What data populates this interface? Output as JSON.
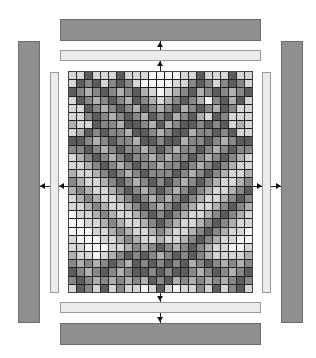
{
  "diagram": {
    "colors": {
      "outer_bar": "#8f8f8f",
      "inner_bar": "#ececec",
      "grid_line": "#222222",
      "arrow": "#111111"
    },
    "grid": {
      "cols": 23,
      "rows": 27,
      "cell_values": [
        [
          1,
          1,
          4,
          1,
          1,
          1,
          4,
          1,
          1,
          1,
          0,
          0,
          0,
          0,
          1,
          1,
          4,
          1,
          1,
          1,
          4,
          1,
          1
        ],
        [
          1,
          4,
          3,
          4,
          1,
          3,
          4,
          3,
          1,
          0,
          0,
          0,
          0,
          1,
          1,
          3,
          4,
          3,
          1,
          3,
          4,
          3,
          1
        ],
        [
          4,
          3,
          2,
          3,
          4,
          3,
          2,
          3,
          4,
          2,
          1,
          0,
          1,
          2,
          3,
          4,
          2,
          3,
          4,
          3,
          2,
          3,
          4
        ],
        [
          1,
          4,
          3,
          2,
          3,
          4,
          3,
          2,
          4,
          3,
          2,
          1,
          2,
          3,
          4,
          3,
          2,
          0,
          3,
          4,
          2,
          4,
          1
        ],
        [
          1,
          1,
          4,
          3,
          2,
          3,
          4,
          3,
          2,
          4,
          3,
          2,
          3,
          4,
          2,
          3,
          4,
          3,
          2,
          4,
          3,
          1,
          1
        ],
        [
          1,
          1,
          3,
          4,
          3,
          2,
          3,
          4,
          3,
          2,
          4,
          3,
          4,
          2,
          3,
          4,
          2,
          1,
          4,
          3,
          1,
          1,
          1
        ],
        [
          2,
          1,
          1,
          4,
          3,
          3,
          2,
          4,
          4,
          3,
          2,
          4,
          2,
          3,
          4,
          4,
          3,
          4,
          3,
          4,
          1,
          2,
          1
        ],
        [
          1,
          2,
          4,
          3,
          4,
          3,
          3,
          2,
          4,
          4,
          3,
          2,
          3,
          4,
          4,
          2,
          3,
          3,
          4,
          3,
          4,
          1,
          1
        ],
        [
          4,
          4,
          3,
          2,
          3,
          4,
          3,
          3,
          2,
          4,
          4,
          3,
          4,
          4,
          2,
          3,
          3,
          4,
          3,
          2,
          3,
          4,
          4
        ],
        [
          3,
          3,
          4,
          3,
          2,
          3,
          4,
          3,
          3,
          2,
          3,
          4,
          3,
          2,
          3,
          3,
          4,
          3,
          2,
          3,
          4,
          3,
          3
        ],
        [
          1,
          2,
          3,
          4,
          3,
          2,
          3,
          4,
          3,
          3,
          2,
          3,
          2,
          3,
          3,
          4,
          3,
          2,
          3,
          4,
          3,
          2,
          1
        ],
        [
          1,
          1,
          2,
          3,
          4,
          3,
          2,
          3,
          4,
          3,
          3,
          2,
          3,
          3,
          4,
          3,
          2,
          3,
          4,
          3,
          2,
          1,
          1
        ],
        [
          2,
          1,
          1,
          2,
          3,
          4,
          3,
          2,
          3,
          4,
          3,
          3,
          3,
          4,
          3,
          2,
          3,
          4,
          3,
          2,
          1,
          1,
          2
        ],
        [
          3,
          2,
          1,
          1,
          2,
          3,
          4,
          3,
          2,
          3,
          4,
          3,
          4,
          3,
          2,
          3,
          4,
          3,
          2,
          1,
          1,
          2,
          3
        ],
        [
          2,
          3,
          2,
          1,
          1,
          2,
          3,
          4,
          3,
          2,
          3,
          4,
          3,
          2,
          3,
          4,
          3,
          2,
          1,
          1,
          2,
          3,
          4
        ],
        [
          1,
          2,
          3,
          2,
          1,
          1,
          2,
          3,
          4,
          3,
          2,
          3,
          2,
          3,
          4,
          3,
          2,
          1,
          1,
          2,
          3,
          4,
          3
        ],
        [
          1,
          1,
          2,
          3,
          2,
          1,
          1,
          2,
          3,
          4,
          3,
          2,
          3,
          4,
          3,
          2,
          1,
          1,
          2,
          3,
          4,
          3,
          2
        ],
        [
          0,
          1,
          1,
          2,
          3,
          2,
          1,
          1,
          2,
          3,
          4,
          3,
          4,
          3,
          2,
          1,
          1,
          2,
          3,
          4,
          3,
          2,
          1
        ],
        [
          0,
          0,
          1,
          1,
          2,
          3,
          2,
          1,
          1,
          2,
          3,
          4,
          3,
          2,
          1,
          1,
          2,
          3,
          4,
          3,
          2,
          1,
          1
        ],
        [
          0,
          0,
          0,
          1,
          1,
          2,
          3,
          2,
          1,
          1,
          2,
          3,
          2,
          1,
          1,
          2,
          3,
          4,
          3,
          2,
          1,
          1,
          0
        ],
        [
          1,
          0,
          0,
          0,
          1,
          1,
          2,
          3,
          2,
          1,
          1,
          2,
          1,
          1,
          2,
          3,
          4,
          3,
          2,
          1,
          1,
          0,
          0
        ],
        [
          1,
          1,
          0,
          0,
          0,
          1,
          1,
          2,
          3,
          2,
          3,
          4,
          3,
          2,
          3,
          4,
          3,
          2,
          1,
          1,
          0,
          0,
          1
        ],
        [
          2,
          1,
          1,
          0,
          1,
          2,
          3,
          4,
          3,
          4,
          3,
          2,
          3,
          4,
          3,
          4,
          3,
          2,
          1,
          1,
          1,
          1,
          2
        ],
        [
          3,
          2,
          3,
          2,
          3,
          4,
          3,
          2,
          4,
          3,
          4,
          3,
          4,
          3,
          4,
          2,
          3,
          4,
          3,
          2,
          3,
          2,
          3
        ],
        [
          4,
          3,
          2,
          3,
          4,
          3,
          2,
          3,
          4,
          4,
          3,
          4,
          3,
          4,
          4,
          3,
          2,
          3,
          4,
          3,
          2,
          3,
          4
        ],
        [
          3,
          4,
          3,
          2,
          3,
          2,
          3,
          2,
          3,
          2,
          4,
          3,
          4,
          2,
          3,
          2,
          3,
          2,
          3,
          2,
          3,
          4,
          3
        ],
        [
          1,
          4,
          3,
          1,
          4,
          1,
          3,
          1,
          1,
          0,
          1,
          4,
          1,
          0,
          1,
          1,
          3,
          1,
          4,
          1,
          3,
          4,
          1
        ]
      ],
      "palette": [
        "#f4f4f4",
        "#d6d6d6",
        "#b0b0b0",
        "#888888",
        "#5c5c5c"
      ]
    },
    "arrows": [
      "up-to-top-inner",
      "up-to-top-outer",
      "down-to-bottom-inner",
      "down-to-bottom-outer",
      "left-to-left-inner",
      "left-to-left-outer",
      "right-to-right-inner",
      "right-to-right-outer"
    ]
  }
}
